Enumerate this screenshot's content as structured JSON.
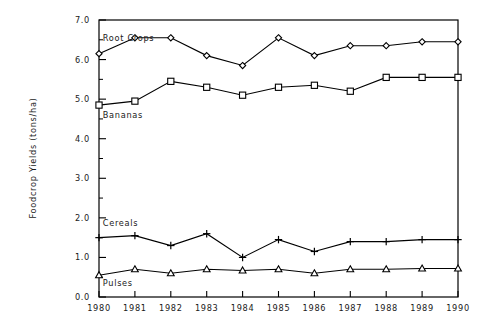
{
  "chart_data": {
    "type": "line",
    "title": "",
    "xlabel": "",
    "ylabel": "Foodcrop Yields (tons/ha)",
    "x": [
      1980,
      1981,
      1982,
      1983,
      1984,
      1985,
      1986,
      1987,
      1988,
      1989,
      1990
    ],
    "xtick_labels": [
      "1980",
      "1981",
      "1982",
      "1983",
      "1984",
      "1985",
      "1986",
      "1987",
      "1988",
      "1989",
      "1990"
    ],
    "ytick_labels": [
      "0.0",
      "1.0",
      "2.0",
      "3.0",
      "4.0",
      "5.0",
      "6.0",
      "7.0"
    ],
    "ytick_values": [
      0.0,
      1.0,
      2.0,
      3.0,
      4.0,
      5.0,
      6.0,
      7.0
    ],
    "yminor_values": [
      0.5,
      1.5,
      2.5,
      3.5,
      4.5,
      5.5,
      6.5
    ],
    "ylim": [
      0.0,
      7.0
    ],
    "xlim": [
      1980,
      1990
    ],
    "grid": false,
    "legend_position": "inline-annotations",
    "series": [
      {
        "name": "Root Crops",
        "marker": "diamond",
        "color": "#000000",
        "values": [
          6.15,
          6.55,
          6.55,
          6.1,
          5.85,
          6.55,
          6.1,
          6.35,
          6.35,
          6.45,
          6.45
        ],
        "label_x": 1980.05,
        "label_y": 6.48
      },
      {
        "name": "Bananas",
        "marker": "square",
        "color": "#000000",
        "values": [
          4.85,
          4.95,
          5.45,
          5.3,
          5.1,
          5.3,
          5.35,
          5.2,
          5.55,
          5.55,
          5.55
        ],
        "label_x": 1980.05,
        "label_y": 4.52
      },
      {
        "name": "Cereals",
        "marker": "plus",
        "color": "#000000",
        "values": [
          1.5,
          1.55,
          1.3,
          1.6,
          1.0,
          1.45,
          1.15,
          1.4,
          1.4,
          1.45,
          1.45
        ],
        "label_x": 1980.05,
        "label_y": 1.8
      },
      {
        "name": "Pulses",
        "marker": "triangle",
        "color": "#000000",
        "values": [
          0.55,
          0.7,
          0.6,
          0.7,
          0.67,
          0.7,
          0.6,
          0.7,
          0.7,
          0.72,
          0.72
        ],
        "label_x": 1980.05,
        "label_y": 0.28
      }
    ]
  }
}
